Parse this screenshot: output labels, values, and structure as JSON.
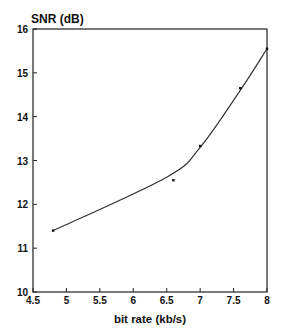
{
  "chart_data": {
    "type": "line",
    "title": "",
    "xlabel": "bit rate (kb/s)",
    "ylabel": "SNR (dB)",
    "xlim": [
      4.5,
      8
    ],
    "ylim": [
      10,
      16
    ],
    "xticks": [
      "4.5",
      "5",
      "5.5",
      "6",
      "6.5",
      "7",
      "7.5",
      "8"
    ],
    "yticks": [
      "10",
      "11",
      "12",
      "13",
      "14",
      "15",
      "16"
    ],
    "grid": false,
    "legend": null,
    "series": [
      {
        "name": "measured points",
        "style": "markers",
        "x": [
          4.8,
          6.6,
          7.0,
          7.6,
          8.0
        ],
        "y": [
          11.4,
          12.55,
          13.33,
          14.65,
          15.55
        ]
      },
      {
        "name": "fitted curve",
        "style": "smooth-line",
        "x": [
          4.8,
          6.5,
          7.0,
          7.6,
          8.0
        ],
        "y": [
          11.4,
          12.62,
          13.3,
          14.6,
          15.55
        ]
      }
    ]
  },
  "labels": {
    "ylabel": "SNR (dB)",
    "xlabel": "bit rate (kb/s)"
  }
}
